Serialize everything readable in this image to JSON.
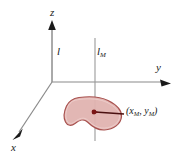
{
  "figure": {
    "background_color": "#ffffff"
  },
  "axes": {
    "z": {
      "label": "z",
      "direction": "up",
      "arrow": true
    },
    "y": {
      "label": "y",
      "direction": "right",
      "arrow": true
    },
    "x": {
      "label": "x",
      "direction": "down-left",
      "arrow": true
    },
    "color": "#808080",
    "origin": {
      "x": 52,
      "y": 82
    }
  },
  "lines": [
    {
      "name": "l",
      "label": "l",
      "subscript": "",
      "orientation": "vertical",
      "x": 52
    },
    {
      "name": "l_M",
      "label": "l",
      "subscript": "M",
      "orientation": "vertical",
      "x": 95
    }
  ],
  "region": {
    "name": "lamina-M",
    "fill_color": "#e0b3b0",
    "stroke_color": "#a04a48",
    "centroid_color": "#8b1a1a"
  },
  "point": {
    "open_paren": "(",
    "x_symbol": "x",
    "x_subscript": "M",
    "separator": ", ",
    "y_symbol": "y",
    "y_subscript": "M",
    "close_paren": ")",
    "full_label": "(x M , y M )"
  }
}
